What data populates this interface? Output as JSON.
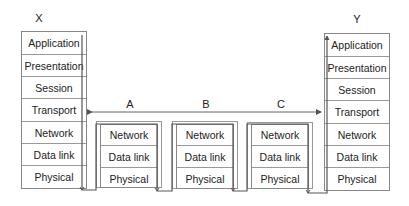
{
  "endpoints": {
    "x": {
      "label": "X",
      "layers": [
        "Application",
        "Presentation",
        "Session",
        "Transport",
        "Network",
        "Data link",
        "Physical"
      ]
    },
    "y": {
      "label": "Y",
      "layers": [
        "Application",
        "Presentation",
        "Session",
        "Transport",
        "Network",
        "Data link",
        "Physical"
      ]
    }
  },
  "intermediate": [
    {
      "label": "A",
      "layers": [
        "Network",
        "Data link",
        "Physical"
      ]
    },
    {
      "label": "B",
      "layers": [
        "Network",
        "Data link",
        "Physical"
      ]
    },
    {
      "label": "C",
      "layers": [
        "Network",
        "Data link",
        "Physical"
      ]
    }
  ],
  "colors": {
    "line": "#555555",
    "border": "#888888"
  }
}
